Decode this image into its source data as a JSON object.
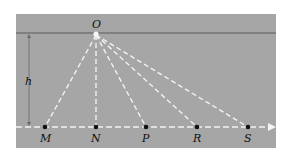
{
  "diagram": {
    "colors": {
      "panel": "#a6a6a6",
      "surface_line": "#5a5a5a",
      "rays": "#f2f2f2",
      "points": "#111111",
      "labels": "#111111",
      "height_marker": "#6a6a6a"
    },
    "source": {
      "label": "O"
    },
    "height": {
      "label": "h"
    },
    "points": [
      {
        "label": "M"
      },
      {
        "label": "N"
      },
      {
        "label": "P"
      },
      {
        "label": "R"
      },
      {
        "label": "S"
      }
    ]
  }
}
